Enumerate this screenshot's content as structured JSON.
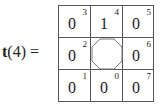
{
  "equation": {
    "function_name": "t",
    "argument": "(4)",
    "equals": "="
  },
  "center_symbol": "octagon-icon",
  "cells": [
    {
      "row": 0,
      "col": 0,
      "value": "0",
      "index": "3"
    },
    {
      "row": 0,
      "col": 1,
      "value": "1",
      "index": "4"
    },
    {
      "row": 0,
      "col": 2,
      "value": "0",
      "index": "5"
    },
    {
      "row": 1,
      "col": 0,
      "value": "0",
      "index": "2"
    },
    {
      "row": 1,
      "col": 2,
      "value": "0",
      "index": "6"
    },
    {
      "row": 2,
      "col": 0,
      "value": "0",
      "index": "1"
    },
    {
      "row": 2,
      "col": 1,
      "value": "0",
      "index": "0"
    },
    {
      "row": 2,
      "col": 2,
      "value": "0",
      "index": "7"
    }
  ]
}
